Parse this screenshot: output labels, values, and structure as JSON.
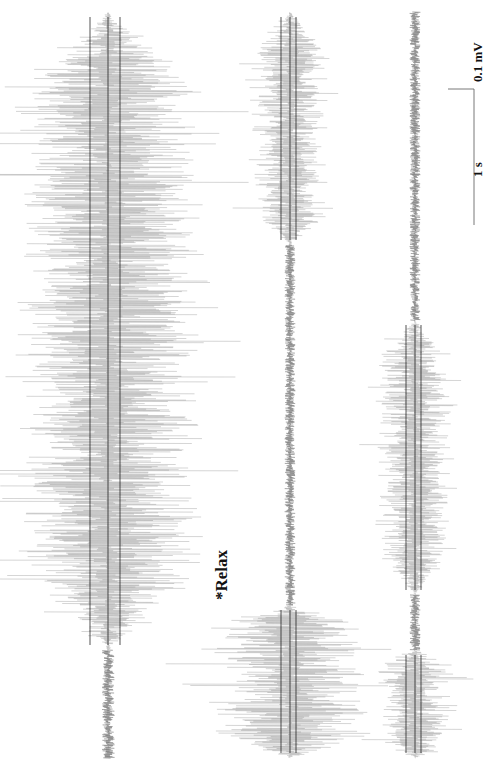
{
  "chart_data": {
    "type": "line",
    "title": "",
    "orientation": "rotated-90-ccw",
    "annotations": [
      "*Relax"
    ],
    "scale_bars": {
      "amplitude": "0.1 mV",
      "time": "1 s"
    },
    "series": [
      {
        "name": "trace-1",
        "x_center": 108,
        "segments": [
          {
            "state": "active",
            "y_start": 12,
            "y_end": 650,
            "amplitude": "high"
          },
          {
            "state": "baseline",
            "y_start": 650,
            "y_end": 758,
            "amplitude": "low"
          }
        ]
      },
      {
        "name": "trace-2",
        "x_center": 290,
        "segments": [
          {
            "state": "active",
            "y_start": 12,
            "y_end": 245,
            "amplitude": "medium"
          },
          {
            "state": "baseline",
            "y_start": 245,
            "y_end": 605,
            "amplitude": "low"
          },
          {
            "state": "active",
            "y_start": 605,
            "y_end": 758,
            "amplitude": "high"
          }
        ]
      },
      {
        "name": "trace-3",
        "x_center": 415,
        "segments": [
          {
            "state": "baseline",
            "y_start": 12,
            "y_end": 320,
            "amplitude": "low"
          },
          {
            "state": "active",
            "y_start": 320,
            "y_end": 595,
            "amplitude": "medium"
          },
          {
            "state": "baseline",
            "y_start": 595,
            "y_end": 650,
            "amplitude": "low"
          },
          {
            "state": "active",
            "y_start": 650,
            "y_end": 758,
            "amplitude": "medium"
          }
        ]
      }
    ]
  },
  "labels": {
    "relax": "*Relax",
    "mv": "0.1 mV",
    "sec": "1 s"
  }
}
